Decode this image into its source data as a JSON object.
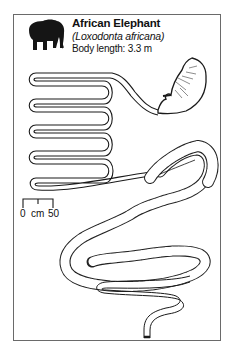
{
  "header": {
    "common_name": "African Elephant",
    "latin_name": "(Loxodonta africana)",
    "body_length": "Body length: 3.3 m"
  },
  "scale_bar": {
    "start_label": "0",
    "unit_label": "cm",
    "end_label": "50"
  },
  "icons": {
    "animal": "elephant-silhouette-icon"
  },
  "diagram": {
    "parts": [
      "stomach",
      "small-intestine",
      "caecum",
      "large-intestine-colon",
      "rectum"
    ]
  }
}
